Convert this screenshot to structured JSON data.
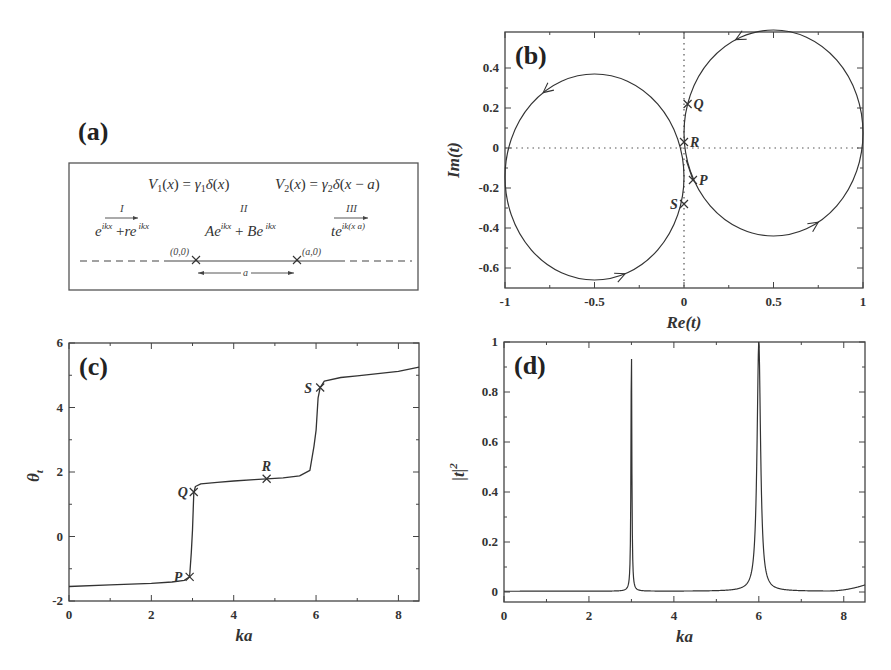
{
  "colors": {
    "line": "#333333",
    "frame": "#444444",
    "dotted": "#555555",
    "background": "#ffffff"
  },
  "panel_a": {
    "label": "(a)",
    "potential_1": "V₁(x) = γ₁δ(x)",
    "potential_2": "V₂(x) = γ₂δ(x − a)",
    "regions": [
      {
        "name": "I",
        "wave": "e^{ikx} + re^{−ikx}"
      },
      {
        "name": "II",
        "wave": "Ae^{ikx} + Be^{−ikx}"
      },
      {
        "name": "III",
        "wave": "te^{ik(x−a)}"
      }
    ],
    "point_1": "(0,0)",
    "point_2": "(a,0)",
    "separation": "a"
  },
  "chart_data": [
    {
      "id": "b",
      "type": "line",
      "panel_label": "(b)",
      "title": "",
      "xlabel": "Re(t)",
      "ylabel": "Im(t)",
      "xlim": [
        -1,
        1
      ],
      "ylim": [
        -0.7,
        0.58
      ],
      "xticks": [
        -1,
        -0.5,
        0,
        0.5,
        1
      ],
      "xtick_labels": [
        "-1",
        "-0.5",
        "0",
        "0.5",
        "1"
      ],
      "yticks": [
        -0.6,
        -0.4,
        -0.2,
        0,
        0.2,
        0.4
      ],
      "ytick_labels": [
        "-0.6",
        "-0.4",
        "-0.2",
        "0",
        "0.2",
        "0.4"
      ],
      "grid": false,
      "reference_lines": [
        "x=0 dotted",
        "y=0 dotted"
      ],
      "series": [
        {
          "name": "left circle",
          "shape": "circle",
          "center": [
            -0.5,
            -0.145
          ],
          "radius": 0.5,
          "direction": "counterclockwise"
        },
        {
          "name": "right circle",
          "shape": "circle",
          "center": [
            0.5,
            0.075
          ],
          "radius": 0.5,
          "direction": "counterclockwise"
        }
      ],
      "markers": [
        {
          "label": "Q",
          "x": 0.02,
          "y": 0.22
        },
        {
          "label": "R",
          "x": 0.0,
          "y": 0.03
        },
        {
          "label": "P",
          "x": 0.05,
          "y": -0.16
        },
        {
          "label": "S",
          "x": 0.0,
          "y": -0.28
        }
      ]
    },
    {
      "id": "c",
      "type": "line",
      "panel_label": "(c)",
      "title": "",
      "xlabel": "ka",
      "ylabel": "θt",
      "xlim": [
        0,
        8.5
      ],
      "ylim": [
        -2,
        6
      ],
      "xticks": [
        0,
        2,
        4,
        6,
        8
      ],
      "xtick_labels": [
        "0",
        "2",
        "4",
        "6",
        "8"
      ],
      "yticks": [
        -2,
        0,
        2,
        4,
        6
      ],
      "ytick_labels": [
        "-2",
        "0",
        "2",
        "4",
        "6"
      ],
      "grid": false,
      "x": [
        0,
        1,
        2,
        2.5,
        2.8,
        2.93,
        2.97,
        3.0,
        3.03,
        3.07,
        3.2,
        3.6,
        4.0,
        4.5,
        4.8,
        5.2,
        5.6,
        5.85,
        5.95,
        6.0,
        6.05,
        6.1,
        6.2,
        6.6,
        7.0,
        7.5,
        8.0,
        8.5
      ],
      "values": [
        -1.55,
        -1.5,
        -1.45,
        -1.41,
        -1.36,
        -1.25,
        -0.5,
        0.2,
        1.35,
        1.55,
        1.63,
        1.68,
        1.72,
        1.76,
        1.79,
        1.82,
        1.88,
        2.05,
        2.8,
        3.3,
        4.3,
        4.62,
        4.82,
        4.93,
        4.98,
        5.05,
        5.12,
        5.25
      ],
      "markers": [
        {
          "label": "P",
          "x": 2.93,
          "y": -1.25
        },
        {
          "label": "Q",
          "x": 3.03,
          "y": 1.38
        },
        {
          "label": "R",
          "x": 4.8,
          "y": 1.79
        },
        {
          "label": "S",
          "x": 6.1,
          "y": 4.62
        }
      ]
    },
    {
      "id": "d",
      "type": "line",
      "panel_label": "(d)",
      "title": "",
      "xlabel": "ka",
      "ylabel": "|t|²",
      "xlim": [
        0,
        8.5
      ],
      "ylim": [
        -0.04,
        1
      ],
      "xticks": [
        0,
        2,
        4,
        6,
        8
      ],
      "xtick_labels": [
        "0",
        "2",
        "4",
        "6",
        "8"
      ],
      "yticks": [
        0,
        0.2,
        0.4,
        0.6,
        0.8,
        1
      ],
      "ytick_labels": [
        "0",
        "0.2",
        "0.4",
        "0.6",
        "0.8",
        "1"
      ],
      "grid": false,
      "peaks": [
        {
          "ka": 3.0,
          "height": 1.0,
          "half_width": 0.012
        },
        {
          "ka": 6.0,
          "height": 1.0,
          "half_width": 0.05
        }
      ],
      "x": [
        0,
        1,
        2,
        2.8,
        2.95,
        3.0,
        3.05,
        3.2,
        4.0,
        5.0,
        5.6,
        5.85,
        5.95,
        6.0,
        6.05,
        6.15,
        6.4,
        7.0,
        8.0,
        8.5
      ],
      "values": [
        0.0,
        0.0,
        0.002,
        0.006,
        0.08,
        1.0,
        0.08,
        0.008,
        0.0,
        0.004,
        0.02,
        0.09,
        0.55,
        1.0,
        0.55,
        0.09,
        0.02,
        0.004,
        0.006,
        0.025
      ]
    }
  ]
}
